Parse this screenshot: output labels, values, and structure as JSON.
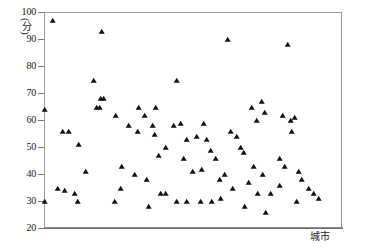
{
  "chart_data": {
    "type": "scatter",
    "title": "",
    "subtitle": "",
    "xlabel": "城市",
    "ylabel": "(分)",
    "ylim": [
      20,
      100
    ],
    "ytick_labels": [
      "100",
      "90",
      "80",
      "70",
      "60",
      "50",
      "40",
      "30",
      "20"
    ],
    "yticks": [
      100,
      90,
      80,
      70,
      60,
      50,
      40,
      30,
      20
    ],
    "xlim": [
      0,
      100
    ],
    "xtick_labels": [],
    "grid": false,
    "legend": null,
    "marker": "triangle-filled",
    "marker_color": "#101010",
    "frame_color": "#9a9a9a",
    "axis_color": "#6e6e6e",
    "background": "#ffffff",
    "series": [
      {
        "name": "城市得分",
        "points": [
          [
            2.7,
            97
          ],
          [
            19.1,
            93
          ],
          [
            0.0,
            64
          ],
          [
            16.5,
            75
          ],
          [
            18.8,
            68
          ],
          [
            19.8,
            68
          ],
          [
            17.6,
            65
          ],
          [
            18.6,
            65
          ],
          [
            23.8,
            62
          ],
          [
            6.0,
            56
          ],
          [
            8.1,
            56
          ],
          [
            11.4,
            51
          ],
          [
            13.8,
            41
          ],
          [
            4.4,
            35
          ],
          [
            6.7,
            34
          ],
          [
            10.1,
            33
          ],
          [
            11.1,
            30
          ],
          [
            0.0,
            30
          ],
          [
            23.5,
            30
          ],
          [
            25.9,
            43
          ],
          [
            28.2,
            58
          ],
          [
            31.2,
            56
          ],
          [
            30.2,
            40
          ],
          [
            25.6,
            35
          ],
          [
            33.6,
            62
          ],
          [
            36.2,
            58
          ],
          [
            37.2,
            65
          ],
          [
            31.5,
            65
          ],
          [
            36.9,
            55
          ],
          [
            38.2,
            47
          ],
          [
            40.5,
            50
          ],
          [
            34.3,
            38
          ],
          [
            38.9,
            33
          ],
          [
            40.5,
            33
          ],
          [
            34.9,
            28
          ],
          [
            44.2,
            75
          ],
          [
            43.2,
            58
          ],
          [
            45.5,
            59
          ],
          [
            47.8,
            53
          ],
          [
            46.5,
            46
          ],
          [
            49.5,
            41
          ],
          [
            44.2,
            30
          ],
          [
            47.5,
            30
          ],
          [
            52.7,
            42
          ],
          [
            51.0,
            54
          ],
          [
            53.4,
            59
          ],
          [
            54.4,
            53
          ],
          [
            55.7,
            49
          ],
          [
            57.4,
            46
          ],
          [
            52.4,
            30
          ],
          [
            56.0,
            30
          ],
          [
            59.1,
            31
          ],
          [
            61.4,
            90
          ],
          [
            65.7,
            50
          ],
          [
            62.4,
            56
          ],
          [
            64.4,
            54
          ],
          [
            66.7,
            48
          ],
          [
            60.4,
            40
          ],
          [
            58.7,
            38
          ],
          [
            63.1,
            35
          ],
          [
            67.0,
            28
          ],
          [
            69.4,
            65
          ],
          [
            72.7,
            67
          ],
          [
            73.7,
            63
          ],
          [
            71.0,
            60
          ],
          [
            70.1,
            43
          ],
          [
            73.0,
            40
          ],
          [
            68.4,
            37
          ],
          [
            71.4,
            33
          ],
          [
            76.0,
            33
          ],
          [
            74.0,
            26
          ],
          [
            81.4,
            88
          ],
          [
            79.7,
            62
          ],
          [
            82.7,
            60
          ],
          [
            84.0,
            61
          ],
          [
            83.0,
            56
          ],
          [
            78.7,
            46
          ],
          [
            80.4,
            43
          ],
          [
            85.3,
            41
          ],
          [
            86.3,
            38
          ],
          [
            79.0,
            36
          ],
          [
            88.6,
            35
          ],
          [
            84.6,
            30
          ],
          [
            90.3,
            33
          ],
          [
            92.0,
            31
          ]
        ]
      }
    ]
  }
}
